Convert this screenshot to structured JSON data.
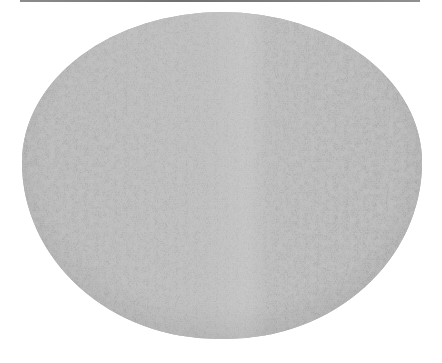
{
  "image": {
    "subject": "textured oval melon rind (grayscale)",
    "description": "A single oval, gray, speckled object resembling a cantaloupe surface centered on a white background with a thin dark line at the top edge."
  },
  "colors": {
    "background": "#ffffff",
    "object_fill": "#b2b2b2",
    "object_highlight": "#bdbdbd",
    "speckle": "#8a8a8a",
    "top_rule": "#7a7a7a"
  }
}
